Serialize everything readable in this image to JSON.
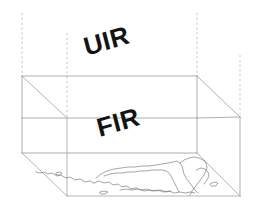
{
  "diagram": {
    "upper_volume": {
      "label": "UIR",
      "name": "upper-information-region"
    },
    "lower_volume": {
      "label": "FIR",
      "name": "flight-information-region"
    },
    "ground": {
      "name": "coastline-map-base"
    },
    "colors": {
      "text": "#141414",
      "edge": "#9a9a9a",
      "edge_strong": "#8a8a8a",
      "dashed": "#b8b8b8",
      "coastline": "#707070",
      "background": "#ffffff"
    },
    "geometry": {
      "front_left_x": 22,
      "front_right_x": 197,
      "back_left_x": 67,
      "back_right_x": 240,
      "top_y": 76,
      "mid_y": 118,
      "base_y": 153,
      "back_top_y": 41,
      "back_mid_y": 83,
      "back_base_y": 118,
      "ground_front_y": 196,
      "dash_top_y": 13
    }
  }
}
